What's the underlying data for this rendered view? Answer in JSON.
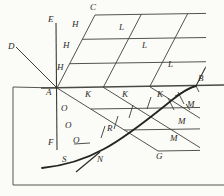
{
  "figure": {
    "width": 224,
    "height": 196,
    "background_color": "#fbfbf8",
    "ink_color": "#2a2a28",
    "line_color": "#3a3a38"
  },
  "labels": {
    "D": "D",
    "E": "E",
    "F": "F",
    "A": "A",
    "B": "B",
    "C": "C",
    "G": "G",
    "H1": "H",
    "H2": "H",
    "H3": "H",
    "L1": "L",
    "L2": "L",
    "L3": "L",
    "K1": "K",
    "K2": "K",
    "K3": "K",
    "M1": "M",
    "M2": "M",
    "M3": "M",
    "O1": "O",
    "O2": "O",
    "O3": "O",
    "R": "R",
    "S": "S",
    "N": "N"
  },
  "points": {
    "A": {
      "x": 57,
      "y": 88,
      "label": "A"
    },
    "B": {
      "x": 196,
      "y": 86,
      "label": "B"
    },
    "C": {
      "x": 95,
      "y": 15,
      "label": "C"
    },
    "G": {
      "x": 158,
      "y": 151,
      "label": "G"
    },
    "D": {
      "x": 12,
      "y": 48,
      "label": "D"
    },
    "E": {
      "x": 53,
      "y": 20,
      "label": "E"
    },
    "F": {
      "x": 53,
      "y": 146,
      "label": "F"
    },
    "R": {
      "x": 112,
      "y": 131,
      "label": "R"
    },
    "S": {
      "x": 66,
      "y": 160,
      "label": "S"
    },
    "N": {
      "x": 100,
      "y": 159,
      "label": "N"
    }
  },
  "grid": {
    "divisions": 3,
    "upper_quad_vertices": [
      "A",
      "C",
      "B"
    ],
    "lower_quad_vertices": [
      "A",
      "G",
      "B"
    ],
    "edge_labels_upper_left": [
      "H",
      "H",
      "H"
    ],
    "edge_labels_upper_right": [
      "L",
      "L",
      "L"
    ],
    "edge_labels_baseline": [
      "K",
      "K",
      "K"
    ],
    "edge_labels_lower_left": [
      "O",
      "O",
      "O"
    ],
    "edge_labels_lower_right": [
      "M",
      "M",
      "M"
    ]
  },
  "frame": {
    "left": 13,
    "top": 87,
    "bottom": 185,
    "description": "open rectangle border, bottom-left"
  },
  "curve": {
    "name": "curve-through-S-N-B",
    "through_labels": [
      "S",
      "N",
      "R",
      "B"
    ]
  }
}
